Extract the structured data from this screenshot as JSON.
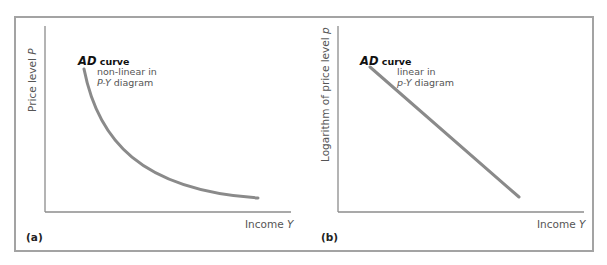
{
  "panels": [
    {
      "tag": "(a)",
      "y_axis_label": "Price level ",
      "y_axis_var": "P",
      "x_axis_label": "Income ",
      "x_axis_var": "Y",
      "curve_name": "AD",
      "curve_word": " curve",
      "note_line1": "non-linear in",
      "note_var": "P-Y",
      "note_line2_rest": " diagram",
      "curve_type": "convex-decreasing"
    },
    {
      "tag": "(b)",
      "y_axis_label": "Logarithm of price level ",
      "y_axis_var": "p",
      "x_axis_label": "Income ",
      "x_axis_var": "Y",
      "curve_name": "AD",
      "curve_word": " curve",
      "note_line1": "linear in",
      "note_var": "p-Y",
      "note_line2_rest": " diagram",
      "curve_type": "linear-decreasing"
    }
  ],
  "colors": {
    "frame": "#a3a3a3",
    "axis": "#8c8c8c",
    "curve": "#8a8a8a"
  }
}
